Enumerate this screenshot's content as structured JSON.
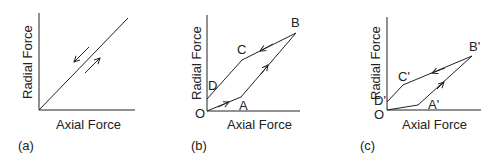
{
  "panels": [
    {
      "id": "a",
      "caption": "(a)",
      "xlabel": "Axial Force",
      "ylabel": "Radial Force",
      "path": [
        [
          39,
          110
        ],
        [
          128,
          18
        ]
      ],
      "arrows": [
        "down-left along line (unloading)",
        "up-right along line (loading)"
      ]
    },
    {
      "id": "b",
      "caption": "(b)",
      "xlabel": "Axial Force",
      "ylabel": "Radial Force",
      "points": {
        "O": "O",
        "A": "A",
        "B": "B",
        "C": "C",
        "D": "D"
      },
      "path_order": [
        "O",
        "A",
        "B",
        "C",
        "D"
      ]
    },
    {
      "id": "c",
      "caption": "(c)",
      "xlabel": "Axial Force",
      "ylabel": "Radial Force",
      "points": {
        "O": "O",
        "A": "A'",
        "B": "B'",
        "C": "C'",
        "D": "D'"
      },
      "path_order": [
        "O",
        "A'",
        "B'",
        "C'",
        "D'"
      ]
    }
  ]
}
